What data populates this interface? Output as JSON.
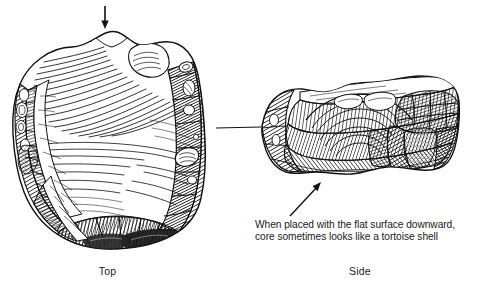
{
  "figure": {
    "kind": "line-art-illustration",
    "background_color": "#ffffff",
    "ink_color": "#111111",
    "width": 484,
    "height": 292
  },
  "labels": {
    "top_view": "Top",
    "side_view": "Side"
  },
  "caption": {
    "line1": "When placed with the flat surface downward,",
    "line2": "core sometimes looks like a tortoise shell"
  },
  "annotations": {
    "strike_arrow_name": "down-arrow-icon",
    "strike_arrow_direction": "down",
    "leader_line_name": "view-connector-line",
    "caption_arrow_name": "caption-pointer-arrow-icon",
    "caption_arrow_direction": "up-right"
  }
}
